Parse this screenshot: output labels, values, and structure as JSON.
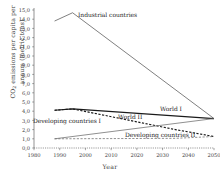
{
  "chart_data": {
    "type": "line",
    "title": "",
    "xlabel": "Year",
    "ylabel": "CO2 emissions per capita per annum (metric tons)",
    "ylabel_prefix": "CO",
    "ylabel_sub": "2",
    "ylabel_rest": " emissions per capita per annum (metric tons)",
    "xlim": [
      1980,
      2050
    ],
    "ylim": [
      0.0,
      15.0
    ],
    "grid": false,
    "legend_position": "inline-annotations",
    "xticks": [
      "1980",
      "1990",
      "2000",
      "2010",
      "2020",
      "2030",
      "2040",
      "2050"
    ],
    "xtick_values": [
      1980,
      1990,
      2000,
      2010,
      2020,
      2030,
      2040,
      2050
    ],
    "yticks": [
      "0,0",
      "1,0",
      "2,0",
      "3,0",
      "4,0",
      "5,0",
      "6,0",
      "7,0",
      "8,0",
      "9,0",
      "10,0",
      "11,0",
      "12,0",
      "13,0",
      "14,0",
      "15,0"
    ],
    "ytick_values": [
      0,
      1,
      2,
      3,
      4,
      5,
      6,
      7,
      8,
      9,
      10,
      11,
      12,
      13,
      14,
      15
    ],
    "series": [
      {
        "name": "Industrial countries",
        "style": "solid",
        "color": "#555555",
        "x": [
          1988,
          1995,
          2050
        ],
        "values": [
          13.8,
          14.7,
          3.2
        ]
      },
      {
        "name": "World I",
        "style": "solid",
        "color": "#1a1a1a",
        "x": [
          1988,
          1995,
          2050
        ],
        "values": [
          4.1,
          4.25,
          3.2
        ]
      },
      {
        "name": "World II",
        "style": "dashed",
        "color": "#1a1a1a",
        "x": [
          1988,
          1995,
          2035,
          2050
        ],
        "values": [
          4.1,
          4.25,
          2.0,
          1.25
        ]
      },
      {
        "name": "Developing countries I",
        "style": "solid",
        "color": "#6b6b6b",
        "x": [
          1988,
          2050
        ],
        "values": [
          1.0,
          3.2
        ]
      },
      {
        "name": "Developing countries II",
        "style": "dashed",
        "color": "#6b6b6b",
        "x": [
          1988,
          2035,
          2050
        ],
        "values": [
          1.0,
          1.05,
          1.25
        ]
      }
    ],
    "annotations": [
      {
        "text": "Industrial countries",
        "series": "Industrial countries"
      },
      {
        "text": "World I",
        "series": "World I"
      },
      {
        "text": "World II",
        "series": "World II"
      },
      {
        "text": "Developing countries I",
        "series": "Developing countries I"
      },
      {
        "text": "Developing countries II",
        "series": "Developing countries II"
      }
    ]
  }
}
